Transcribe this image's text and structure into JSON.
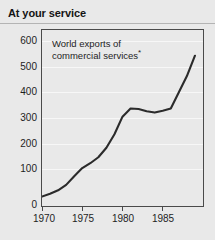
{
  "header": {
    "title": "At your service"
  },
  "chart_data": {
    "type": "line",
    "title": "At your service",
    "annotation": "World exports of commercial services",
    "annotation_line1": "World exports of",
    "annotation_line2": "commercial services",
    "annotation_footnote_marker": "*",
    "xlabel": "",
    "ylabel": "",
    "xlim": [
      1970,
      1990
    ],
    "ylim": [
      0,
      650
    ],
    "grid": true,
    "legend_position": "none",
    "line_color": "#2b2b2b",
    "background_color": "#e9e9e9",
    "gridline_color": "#f7f7f7",
    "axis_color": "#4a4a4a",
    "y_ticks": [
      0,
      100,
      200,
      300,
      400,
      500,
      600
    ],
    "y_tick_labels": [
      "0",
      "100",
      "200",
      "300",
      "400",
      "500",
      "600"
    ],
    "x_ticks": [
      1970,
      1975,
      1980,
      1985
    ],
    "x_tick_labels": [
      "1970",
      "1975",
      "1980",
      "1985"
    ],
    "x": [
      1970,
      1971,
      1972,
      1973,
      1974,
      1975,
      1976,
      1977,
      1978,
      1979,
      1980,
      1981,
      1982,
      1983,
      1984,
      1985,
      1986,
      1987,
      1988,
      1989
    ],
    "values": [
      35,
      45,
      58,
      78,
      110,
      140,
      158,
      180,
      215,
      265,
      330,
      360,
      358,
      350,
      345,
      352,
      360,
      420,
      480,
      555
    ],
    "series": [
      {
        "name": "World exports of commercial services",
        "values": [
          35,
          45,
          58,
          78,
          110,
          140,
          158,
          180,
          215,
          265,
          330,
          360,
          358,
          350,
          345,
          352,
          360,
          420,
          480,
          555
        ]
      }
    ]
  }
}
